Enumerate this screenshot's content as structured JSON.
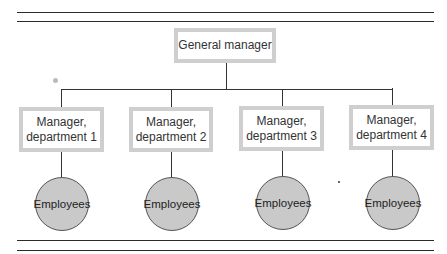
{
  "diagram": {
    "type": "org-chart",
    "root": {
      "label": "General manager"
    },
    "managers": [
      {
        "line1": "Manager,",
        "line2": "department 1"
      },
      {
        "line1": "Manager,",
        "line2": "department 2"
      },
      {
        "line1": "Manager,",
        "line2": "department 3"
      },
      {
        "line1": "Manager,",
        "line2": "department 4"
      }
    ],
    "employees": [
      {
        "label": "Employees"
      },
      {
        "label": "Employees"
      },
      {
        "label": "Employees"
      },
      {
        "label": "Employees"
      }
    ],
    "colors": {
      "box_border": "#cfcfcf",
      "circle_fill": "#c9c9c9",
      "line": "#333333"
    }
  }
}
